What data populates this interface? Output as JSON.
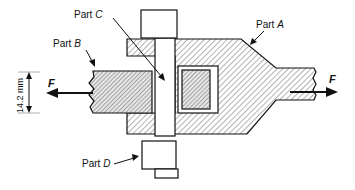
{
  "diagram": {
    "labels": {
      "part_a": {
        "prefix": "Part ",
        "letter": "A"
      },
      "part_b": {
        "prefix": "Part ",
        "letter": "B"
      },
      "part_c": {
        "prefix": "Part ",
        "letter": "C"
      },
      "part_d": {
        "prefix": "Part ",
        "letter": "D"
      }
    },
    "forces": {
      "left": "F",
      "right": "F"
    },
    "dimension": {
      "value": "14.2 mm"
    },
    "colors": {
      "stroke": "#111111",
      "hatch": "#555555",
      "fill_light": "#ffffff",
      "fill_dense": "#dddddd"
    }
  }
}
